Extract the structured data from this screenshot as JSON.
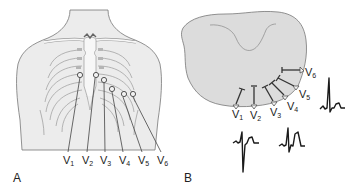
{
  "figure": {
    "panels": [
      {
        "id": "A",
        "label": "A",
        "description": "Anterior chest with precordial electrode positions",
        "leads": [
          {
            "name": "V",
            "sub": "1"
          },
          {
            "name": "V",
            "sub": "2"
          },
          {
            "name": "V",
            "sub": "3"
          },
          {
            "name": "V",
            "sub": "4"
          },
          {
            "name": "V",
            "sub": "5"
          },
          {
            "name": "V",
            "sub": "6"
          }
        ]
      },
      {
        "id": "B",
        "label": "B",
        "description": "Transverse section of chest with precordial leads and ECG complexes",
        "leads": [
          {
            "name": "V",
            "sub": "1"
          },
          {
            "name": "V",
            "sub": "2"
          },
          {
            "name": "V",
            "sub": "3"
          },
          {
            "name": "V",
            "sub": "4"
          },
          {
            "name": "V",
            "sub": "5"
          },
          {
            "name": "V",
            "sub": "6"
          }
        ],
        "waveforms": [
          {
            "lead": "V1-V2",
            "shape": "deep-S"
          },
          {
            "lead": "V3-V4",
            "shape": "RS-transition"
          },
          {
            "lead": "V5-V6",
            "shape": "tall-R"
          }
        ]
      }
    ],
    "colors": {
      "skin": "#ececec",
      "outline": "#777777",
      "bone": "#f7f7f7",
      "cartilage": "#b5b5b5",
      "section": "#dcdcdc",
      "ink": "#222222"
    }
  }
}
